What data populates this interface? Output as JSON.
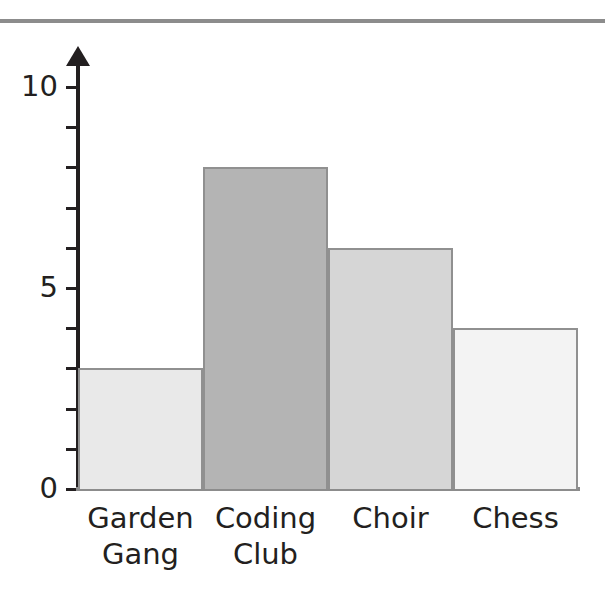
{
  "chart_data": {
    "type": "bar",
    "title": "",
    "subtitle": "",
    "xlabel": "",
    "ylabel": "",
    "categories": [
      "Garden Gang",
      "Coding Club",
      "Choir",
      "Chess"
    ],
    "values": [
      3,
      8,
      6,
      4
    ],
    "ylim": [
      0,
      10
    ],
    "ytick_values": [
      0,
      1,
      2,
      3,
      4,
      5,
      6,
      7,
      8,
      9,
      10
    ],
    "ytick_labels_shown": [
      "0",
      "5",
      "10"
    ],
    "grid": false,
    "legend": false,
    "bar_colors": [
      "#e9e9e9",
      "#b4b4b4",
      "#d6d6d6",
      "#f3f3f3"
    ],
    "bar_border_color": "#909090",
    "axis_color": "#231f20",
    "baseline_color": "#8c8c8c",
    "annotations": []
  },
  "axis": {
    "y_labels": [
      {
        "text": "10",
        "value": 10
      },
      {
        "text": "5",
        "value": 5
      },
      {
        "text": "0",
        "value": 0
      }
    ]
  },
  "bars": [
    {
      "label": "Garden\nGang",
      "value": 3,
      "color": "#e9e9e9"
    },
    {
      "label": "Coding\nClub",
      "value": 8,
      "color": "#b4b4b4"
    },
    {
      "label": "Choir",
      "value": 6,
      "color": "#d6d6d6"
    },
    {
      "label": "Chess",
      "value": 4,
      "color": "#f3f3f3"
    }
  ],
  "decor": {
    "top_rule_color": "#8c8c8c"
  }
}
